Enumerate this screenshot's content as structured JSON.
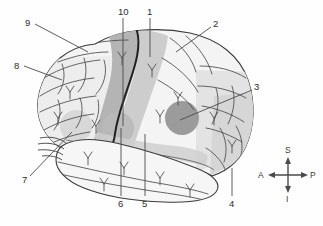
{
  "figure": {
    "type": "anatomical-diagram",
    "background_color": "#fefefe",
    "line_color": "#3b3b3b"
  },
  "labels": [
    {
      "id": "10",
      "text": "10",
      "x": 118,
      "y": 7,
      "leader": "vertical",
      "target": "precentral gyrus"
    },
    {
      "id": "1",
      "text": "1",
      "x": 147,
      "y": 7,
      "leader": "vertical",
      "target": "central sulcus"
    },
    {
      "id": "2",
      "text": "2",
      "x": 213,
      "y": 19,
      "leader": "diagonal",
      "target": "postcentral / parietal lobe"
    },
    {
      "id": "3",
      "text": "3",
      "x": 254,
      "y": 82,
      "leader": "diagonal",
      "target": "Wernicke area"
    },
    {
      "id": "4",
      "text": "4",
      "x": 229,
      "y": 199,
      "leader": "vertical",
      "target": "occipital lobe"
    },
    {
      "id": "5",
      "text": "5",
      "x": 142,
      "y": 199,
      "leader": "vertical",
      "target": "lateral sulcus"
    },
    {
      "id": "6",
      "text": "6",
      "x": 118,
      "y": 199,
      "leader": "vertical",
      "target": "Broca area"
    },
    {
      "id": "7",
      "text": "7",
      "x": 22,
      "y": 175,
      "leader": "diagonal",
      "target": "temporal pole"
    },
    {
      "id": "8",
      "text": "8",
      "x": 14,
      "y": 61,
      "leader": "diagonal",
      "target": "frontal lobe"
    },
    {
      "id": "9",
      "text": "9",
      "x": 25,
      "y": 18,
      "leader": "diagonal",
      "target": "superior frontal gyrus"
    }
  ],
  "compass": {
    "name": "orientation-compass",
    "superior": "S",
    "inferior": "I",
    "anterior": "A",
    "posterior": "P",
    "center_x": 288,
    "center_y": 175
  },
  "shading": {
    "cortex_fill": "#f2f2f2",
    "light_gray": "#dcdcdc",
    "mid_gray": "#c0c0c0",
    "dark_gray": "#a0a0a0",
    "darkest_gray": "#8f8f8f"
  }
}
